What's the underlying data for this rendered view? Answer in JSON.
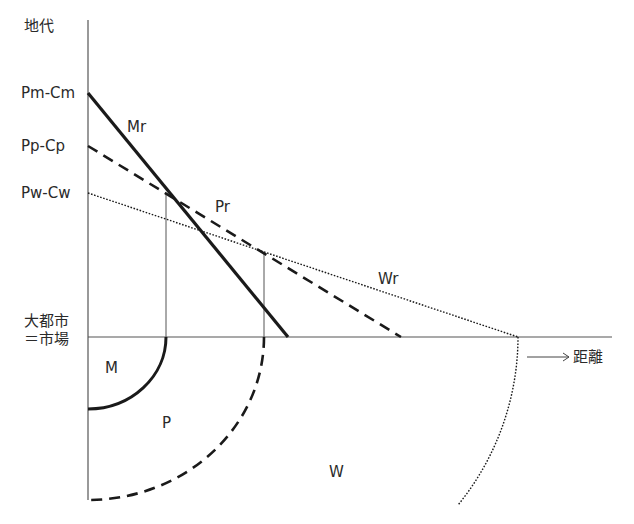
{
  "axes": {
    "y_label": "地代",
    "x_label": "距離",
    "origin_label_line1": "大都市",
    "origin_label_line2": "＝市場"
  },
  "y_ticks": [
    {
      "label": "Pm-Cm",
      "y": 93
    },
    {
      "label": "Pp-Cp",
      "y": 146
    },
    {
      "label": "Pw-Cw",
      "y": 193
    }
  ],
  "rent_lines": [
    {
      "name": "Mr",
      "style": "solid-thick",
      "y0": 93,
      "x_intercept": 288
    },
    {
      "name": "Pr",
      "style": "dashed",
      "y0": 146,
      "x_intercept": 401
    },
    {
      "name": "Wr",
      "style": "dotted",
      "y0": 193,
      "x_intercept": 518
    }
  ],
  "zones": [
    {
      "name": "M",
      "style": "solid-thick",
      "radius": 78
    },
    {
      "name": "P",
      "style": "dashed",
      "radius": 176
    },
    {
      "name": "W",
      "style": "dotted",
      "radius": 430
    }
  ],
  "colors": {
    "line": "#222222",
    "axis": "#555555",
    "background": "#ffffff"
  }
}
